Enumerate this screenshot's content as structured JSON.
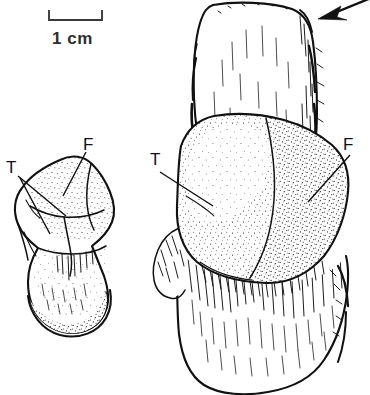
{
  "figure": {
    "kind": "scientific-line-drawing",
    "background_color": "#ffffff",
    "ink_color": "#111111",
    "width": 370,
    "height": 395
  },
  "scale_bar": {
    "label": "1 cm",
    "bracket_x_start": 48,
    "bracket_x_end": 103,
    "bracket_y": 20,
    "tick_height": 10,
    "color": "#3a3a3a"
  },
  "specimens": [
    {
      "id": "left-specimen",
      "name": "small bone specimen (left, lateral view)",
      "labels": [
        {
          "text": "T",
          "x": 8,
          "y": 172,
          "leader_count": 2
        },
        {
          "text": "F",
          "x": 84,
          "y": 149,
          "leader_count": 1
        }
      ]
    },
    {
      "id": "right-specimen",
      "name": "large bone specimen (right, enlarged view)",
      "labels": [
        {
          "text": "T",
          "x": 152,
          "y": 163,
          "leader_count": 1
        },
        {
          "text": "F",
          "x": 345,
          "y": 150,
          "leader_count": 1
        }
      ]
    }
  ],
  "annotations": [
    {
      "id": "arrow-annotation",
      "type": "arrow",
      "description": "solid arrow pointing down-left at the proximal margin of the large specimen",
      "tail_x": 370,
      "tail_y": 0,
      "tip_x": 318,
      "tip_y": 19
    }
  ],
  "label_legend": {
    "T": "T",
    "F": "F"
  }
}
